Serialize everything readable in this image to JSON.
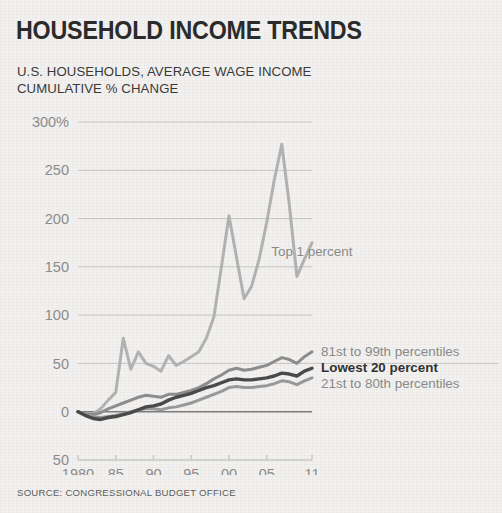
{
  "header": {
    "title": "HOUSEHOLD INCOME TRENDS",
    "subtitle": "U.S. HOUSEHOLDS, AVERAGE WAGE INCOME\nCUMULATIVE % CHANGE"
  },
  "footer": {
    "source": "SOURCE: CONGRESSIONAL BUDGET OFFICE"
  },
  "colors": {
    "background": "#f2f1ef",
    "title": "#2b2b2b",
    "subtitle": "#3a3a3a",
    "axis_text": "#8c8c8c",
    "gridline": "#c9c8c6",
    "zero_line": "#7d7d7d",
    "series_light": "#b3b3b3",
    "series_mid": "#8e8e8e",
    "series_dark": "#4a4a4a",
    "source_text": "#5d5d5d"
  },
  "chart_data": {
    "type": "line",
    "title": "HOUSEHOLD INCOME TRENDS",
    "subtitle": "U.S. HOUSEHOLDS, AVERAGE WAGE INCOME CUMULATIVE % CHANGE",
    "xlabel": "",
    "ylabel": "CUMULATIVE % CHANGE",
    "xlim": [
      1980,
      2011
    ],
    "ylim": [
      -50,
      300
    ],
    "grid": true,
    "legend_position": "inline-right",
    "x_tick_values": [
      1980,
      1985,
      1990,
      1995,
      2000,
      2005,
      2011
    ],
    "x_tick_labels": [
      "1980",
      "85",
      "90",
      "95",
      "00",
      "05",
      "11"
    ],
    "y_tick_values": [
      300,
      250,
      200,
      150,
      100,
      50,
      0,
      -50
    ],
    "y_tick_labels": [
      "300%",
      "250",
      "200",
      "150",
      "100",
      "50",
      "0",
      "50"
    ],
    "x": [
      1980,
      1981,
      1982,
      1983,
      1984,
      1985,
      1986,
      1987,
      1988,
      1989,
      1990,
      1991,
      1992,
      1993,
      1994,
      1995,
      1996,
      1997,
      1998,
      1999,
      2000,
      2001,
      2002,
      2003,
      2004,
      2005,
      2006,
      2007,
      2008,
      2009,
      2010,
      2011
    ],
    "series": [
      {
        "name": "Top 1 percent",
        "color": "#b3b3b3",
        "emphasis": false,
        "label_x": 2005.6,
        "label_y": 166,
        "values": [
          0,
          -3,
          -2,
          3,
          12,
          20,
          76,
          44,
          62,
          50,
          47,
          42,
          58,
          48,
          52,
          57,
          62,
          76,
          98,
          150,
          203,
          160,
          117,
          130,
          158,
          196,
          240,
          277,
          214,
          140,
          158,
          175
        ]
      },
      {
        "name": "81st to 99th percentiles",
        "color": "#8e8e8e",
        "emphasis": false,
        "label_x": 2012.2,
        "label_y": 63,
        "values": [
          0,
          -2,
          -3,
          -1,
          3,
          6,
          9,
          12,
          15,
          17,
          16,
          15,
          18,
          18,
          20,
          22,
          25,
          29,
          34,
          38,
          43,
          45,
          43,
          44,
          46,
          48,
          52,
          56,
          54,
          50,
          57,
          62
        ]
      },
      {
        "name": "Lowest 20 percent",
        "color": "#4a4a4a",
        "emphasis": true,
        "label_x": 2012.2,
        "label_y": 46,
        "values": [
          0,
          -4,
          -7,
          -8,
          -6,
          -5,
          -3,
          -1,
          2,
          5,
          6,
          8,
          12,
          15,
          17,
          19,
          22,
          25,
          27,
          30,
          33,
          34,
          33,
          33,
          34,
          35,
          37,
          40,
          39,
          37,
          42,
          45
        ]
      },
      {
        "name": "21st to 80th percentiles",
        "color": "#9a9a9a",
        "emphasis": false,
        "label_x": 2012.2,
        "label_y": 30,
        "values": [
          0,
          -3,
          -5,
          -6,
          -5,
          -4,
          -2,
          0,
          2,
          3,
          3,
          2,
          4,
          5,
          7,
          9,
          12,
          15,
          18,
          21,
          25,
          26,
          25,
          25,
          26,
          27,
          29,
          32,
          31,
          28,
          32,
          35
        ]
      }
    ]
  }
}
